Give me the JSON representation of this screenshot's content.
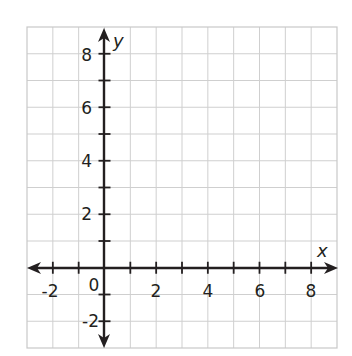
{
  "chart_data": {
    "type": "scatter",
    "title": "",
    "xlabel": "x",
    "ylabel": "y",
    "xlim": [
      -3,
      9
    ],
    "ylim": [
      -3,
      9
    ],
    "grid": true,
    "x_ticks": [
      -2,
      -1,
      1,
      2,
      3,
      4,
      5,
      6,
      7,
      8
    ],
    "y_ticks": [
      -2,
      -1,
      1,
      2,
      3,
      4,
      5,
      6,
      7,
      8
    ],
    "x_tick_labels": [
      "-2",
      "2",
      "4",
      "6",
      "8"
    ],
    "y_tick_labels": [
      "8",
      "6",
      "4",
      "2",
      "-2"
    ],
    "origin_label": "0",
    "series": [],
    "legend": null
  },
  "colors": {
    "grid": "#cfcfcf",
    "axis": "#231f20",
    "background": "#ffffff"
  },
  "labels": {
    "x_axis_name": "x",
    "y_axis_name": "y",
    "origin": "0",
    "x": {
      "neg2": "-2",
      "p2": "2",
      "p4": "4",
      "p6": "6",
      "p8": "8"
    },
    "y": {
      "neg2": "-2",
      "p2": "2",
      "p4": "4",
      "p6": "6",
      "p8": "8"
    }
  }
}
